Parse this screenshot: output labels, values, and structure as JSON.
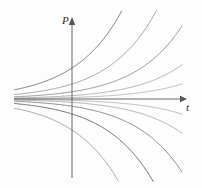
{
  "figure": {
    "name": "slope-field-solution-curves",
    "background_color": "#fdfdfd"
  },
  "axes": {
    "vertical": {
      "label": "P",
      "name": "vertical-axis-P",
      "color": "#555555",
      "x": 72,
      "y_top": 22,
      "y_bottom": 178,
      "arrow": "up"
    },
    "horizontal": {
      "label": "t",
      "name": "horizontal-axis-t",
      "color": "#555555",
      "y": 99,
      "x_left": 14,
      "x_right": 183,
      "arrow": "right"
    },
    "origin": {
      "x": 72,
      "y": 99
    }
  },
  "chart_data": {
    "type": "line",
    "title": "",
    "xlabel": "t",
    "ylabel": "P",
    "grid": false,
    "legend": null,
    "xlim": [
      -2.9,
      2.2
    ],
    "ylim": [
      -2.6,
      2.4
    ],
    "equation": "P = C e^{kt}",
    "growth_rate_k": 1.05,
    "series": [
      {
        "name": "C = 0.62",
        "C": 0.62,
        "color": "#6e6e6e",
        "width": 0.9
      },
      {
        "name": "C = 0.30",
        "C": 0.3,
        "color": "#9a9a9a",
        "width": 0.9
      },
      {
        "name": "C = 0.145",
        "C": 0.145,
        "color": "#8a8a8a",
        "width": 0.9
      },
      {
        "name": "C = 0.068",
        "C": 0.068,
        "color": "#a8a8a8",
        "width": 0.9
      },
      {
        "name": "C = 0.030",
        "C": 0.03,
        "color": "#b2b2b2",
        "width": 0.9
      },
      {
        "name": "C = -0.030",
        "C": -0.03,
        "color": "#b2b2b2",
        "width": 0.9
      },
      {
        "name": "C = -0.068",
        "C": -0.068,
        "color": "#a8a8a8",
        "width": 0.9
      },
      {
        "name": "C = -0.145",
        "C": -0.145,
        "color": "#7c7c7c",
        "width": 0.9
      },
      {
        "name": "C = -0.30",
        "C": -0.3,
        "color": "#5c5c5c",
        "width": 0.9
      },
      {
        "name": "C = -0.62",
        "C": -0.62,
        "color": "#9a9a9a",
        "width": 0.9
      }
    ],
    "scale": {
      "x_origin_px": 72,
      "y_origin_px": 99,
      "px_per_unit_x": 50,
      "px_per_unit_y": 50
    },
    "clip": {
      "x_min_px": 14,
      "x_max_px": 196,
      "y_min_px": 10,
      "y_max_px": 182
    }
  }
}
